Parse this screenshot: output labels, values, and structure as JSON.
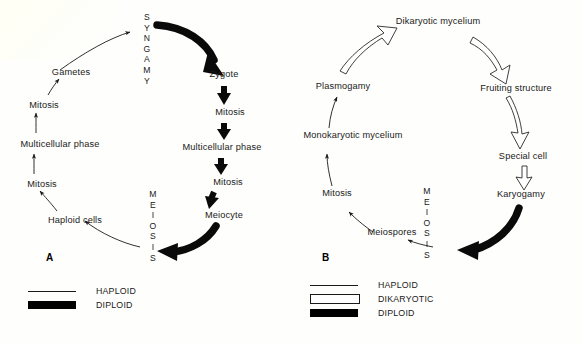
{
  "figure": {
    "background_color": "#fefefc",
    "ink_color": "#1a1a1a"
  },
  "panel_a": {
    "letter": "A",
    "syngamy": [
      "S",
      "Y",
      "N",
      "G",
      "A",
      "M",
      "Y"
    ],
    "meiosis": [
      "M",
      "E",
      "I",
      "O",
      "S",
      "I",
      "S"
    ],
    "nodes": {
      "gametes": "Gametes",
      "mitosis_1": "Mitosis",
      "multicellular_phase_1": "Multicellular phase",
      "mitosis_2": "Mitosis",
      "haploid_cells": "Haploid cells",
      "zygote": "Zygote",
      "mitosis_3": "Mitosis",
      "multicellular_phase_2": "Multicellular phase",
      "mitosis_4": "Mitosis",
      "meiocyte": "Meiocyte"
    },
    "legend": [
      {
        "key": "haploid",
        "label": "HAPLOID"
      },
      {
        "key": "diploid",
        "label": "DIPLOID"
      }
    ]
  },
  "panel_b": {
    "letter": "B",
    "meiosis": [
      "M",
      "E",
      "I",
      "O",
      "S",
      "I",
      "S"
    ],
    "nodes": {
      "dikaryotic_mycelium": "Dikaryotic mycelium",
      "plasmogamy": "Plasmogamy",
      "monokaryotic_mycelium": "Monokaryotic mycelium",
      "mitosis": "Mitosis",
      "meiospores": "Meiospores",
      "fruiting_structure": "Fruiting structure",
      "special_cell": "Special cell",
      "karyogamy": "Karyogamy"
    },
    "legend": [
      {
        "key": "haploid",
        "label": "HAPLOID"
      },
      {
        "key": "dikaryotic",
        "label": "DIKARYOTIC"
      },
      {
        "key": "diploid",
        "label": "DIPLOID"
      }
    ]
  }
}
